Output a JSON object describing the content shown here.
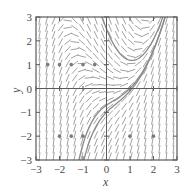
{
  "chart_data": {
    "type": "slope-field",
    "title": "",
    "xlabel": "x",
    "ylabel": "y",
    "xlim": [
      -3,
      3
    ],
    "ylim": [
      -3,
      3
    ],
    "x_ticks": [
      "-3",
      "-2",
      "-1",
      "0",
      "1",
      "2",
      "3"
    ],
    "y_ticks": [
      "-3",
      "-2",
      "-1",
      "0",
      "1",
      "2",
      "3"
    ],
    "grid": false,
    "legend": null,
    "field_equation": "dy/dx = x^2 - y",
    "field_spacing": 0.3,
    "solution_curves": [
      {
        "name": "curve-u-shaped",
        "C": 0.5,
        "formula": "y = x^2 - 2x + 2 + C*e^(-x)",
        "approx_minimum": [
          1.0,
          1.2
        ]
      },
      {
        "name": "curve-through-0-neg1",
        "C": -3.0,
        "formula": "y = x^2 - 2x + 2 + C*e^(-x)",
        "passes_through": [
          0,
          -1
        ]
      },
      {
        "name": "curve-near-upper-right",
        "C": -2.7,
        "formula": "y = x^2 - 2x + 2 + C*e^(-x)"
      }
    ],
    "markers": [
      {
        "y": 1,
        "x": [
          -2.5,
          -2,
          -1.5,
          -1,
          -0.5
        ]
      },
      {
        "y": -2,
        "x": [
          -2,
          -1.5,
          -1,
          1,
          2
        ]
      }
    ]
  },
  "colors": {
    "frame": "#5a5a5a",
    "field": "#8a8a8a",
    "curve": "#8c8c8c",
    "marker": "#7a7a7a",
    "text": "#4a4a4a"
  }
}
